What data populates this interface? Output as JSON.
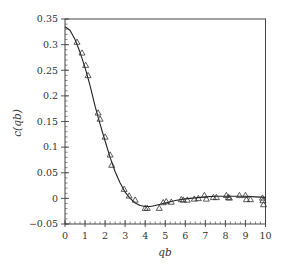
{
  "chart_data": {
    "type": "line",
    "title": "",
    "xlabel": "qb",
    "ylabel": "c(qb)",
    "xlim": [
      0,
      10
    ],
    "ylim": [
      -0.05,
      0.35
    ],
    "xticks": [
      0,
      1,
      2,
      3,
      4,
      5,
      6,
      7,
      8,
      9,
      10
    ],
    "xtick_labels": [
      "0",
      "1",
      "2",
      "3",
      "4",
      "5",
      "6",
      "7",
      "8",
      "9",
      "10"
    ],
    "yticks": [
      -0.05,
      0,
      0.05,
      0.1,
      0.15,
      0.2,
      0.25,
      0.3,
      0.35
    ],
    "ytick_labels": [
      "−0.05",
      "0",
      "0.05",
      "0.1",
      "0.15",
      "0.2",
      "0.25",
      "0.3",
      "0.35"
    ],
    "grid": false,
    "legend": null,
    "series": [
      {
        "name": "theory",
        "style": "solid-line",
        "x": [
          0,
          0.25,
          0.5,
          0.75,
          1.0,
          1.25,
          1.5,
          1.75,
          2.0,
          2.25,
          2.5,
          2.75,
          3.0,
          3.25,
          3.5,
          3.75,
          4.0,
          4.25,
          4.5,
          5.0,
          5.5,
          6.0,
          6.5,
          7.0,
          7.5,
          8.0,
          8.5,
          9.0,
          9.5,
          10.0
        ],
        "y": [
          0.335,
          0.328,
          0.31,
          0.285,
          0.255,
          0.22,
          0.18,
          0.145,
          0.112,
          0.08,
          0.052,
          0.03,
          0.012,
          0.0,
          -0.009,
          -0.014,
          -0.016,
          -0.016,
          -0.014,
          -0.009,
          -0.004,
          -0.001,
          0.001,
          0.003,
          0.004,
          0.004,
          0.004,
          0.004,
          0.003,
          0.002
        ]
      },
      {
        "name": "data",
        "style": "open-triangle-markers",
        "x": [
          0.6,
          0.85,
          1.03,
          1.15,
          1.65,
          1.75,
          2.0,
          2.25,
          2.33,
          2.95,
          3.2,
          3.5,
          4.0,
          4.1,
          4.7,
          4.9,
          5.05,
          5.3,
          5.8,
          5.9,
          6.1,
          6.45,
          6.65,
          6.95,
          7.05,
          7.4,
          7.55,
          8.05,
          8.15,
          8.2,
          8.7,
          9.0,
          9.05,
          9.25,
          9.85,
          9.87,
          9.9
        ],
        "y": [
          0.305,
          0.284,
          0.26,
          0.24,
          0.167,
          0.155,
          0.12,
          0.085,
          0.065,
          0.018,
          0.005,
          -0.003,
          -0.019,
          -0.019,
          -0.019,
          -0.008,
          -0.006,
          -0.007,
          -0.002,
          -0.003,
          -0.003,
          -0.001,
          0.0,
          0.006,
          -0.001,
          0.002,
          0.002,
          0.006,
          0.002,
          0.001,
          0.006,
          0.006,
          -0.002,
          -0.002,
          0.001,
          -0.004,
          -0.012
        ]
      }
    ]
  }
}
